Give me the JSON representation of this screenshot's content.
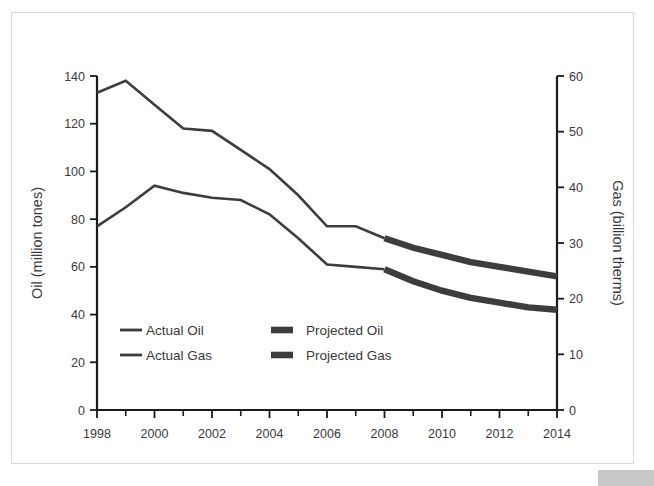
{
  "figure": {
    "background_color": "#ffffff",
    "frame_color": "#d9d9d9",
    "line_color": "#3d3d3d",
    "corner_block_color": "#c9c9c9"
  },
  "chart_data": {
    "type": "line",
    "title": "",
    "xlabel": "",
    "ylabel": "Oil (million tones)",
    "y2label": "Gas (billion therms)",
    "x": [
      1998,
      1999,
      2000,
      2001,
      2002,
      2003,
      2004,
      2005,
      2006,
      2007,
      2008,
      2009,
      2010,
      2011,
      2012,
      2013,
      2014
    ],
    "xtick_labels": [
      "1998",
      "2000",
      "2002",
      "2004",
      "2006",
      "2008",
      "2010",
      "2012",
      "2014"
    ],
    "xtick_values": [
      1998,
      2000,
      2002,
      2004,
      2006,
      2008,
      2010,
      2012,
      2014
    ],
    "xlim": [
      1998,
      2014
    ],
    "ylim": [
      0,
      140
    ],
    "ytick_labels": [
      "0",
      "20",
      "40",
      "60",
      "80",
      "100",
      "120",
      "140"
    ],
    "ytick_values": [
      0,
      20,
      40,
      60,
      80,
      100,
      120,
      140
    ],
    "y2lim": [
      0,
      60
    ],
    "y2tick_labels": [
      "0",
      "10",
      "20",
      "30",
      "40",
      "50",
      "60"
    ],
    "y2tick_values": [
      0,
      10,
      20,
      30,
      40,
      50,
      60
    ],
    "grid": false,
    "legend_position": "inside-lower-left",
    "series": [
      {
        "name": "Actual Oil",
        "style": "thin",
        "axis": "left",
        "units": "million tones",
        "x": [
          1998,
          1999,
          2000,
          2001,
          2002,
          2003,
          2004,
          2005,
          2006,
          2007,
          2008
        ],
        "values": [
          133,
          138,
          128,
          118,
          117,
          109,
          101,
          90,
          77,
          77,
          72
        ]
      },
      {
        "name": "Projected Oil",
        "style": "thick",
        "axis": "left",
        "units": "million tones",
        "x": [
          2008,
          2009,
          2010,
          2011,
          2012,
          2013,
          2014
        ],
        "values": [
          72,
          68,
          65,
          62,
          60,
          58,
          56
        ]
      },
      {
        "name": "Actual Gas",
        "style": "thin",
        "axis": "left",
        "units": "million tones equivalent",
        "x": [
          1998,
          1999,
          2000,
          2001,
          2002,
          2003,
          2004,
          2005,
          2006,
          2007,
          2008
        ],
        "values": [
          77,
          85,
          94,
          91,
          89,
          88,
          82,
          72,
          61,
          60,
          59
        ]
      },
      {
        "name": "Projected Gas",
        "style": "thick",
        "axis": "left",
        "units": "million tones equivalent",
        "x": [
          2008,
          2009,
          2010,
          2011,
          2012,
          2013,
          2014
        ],
        "values": [
          59,
          54,
          50,
          47,
          45,
          43,
          42
        ]
      }
    ]
  },
  "axes": {
    "left_title": "Oil (million tones)",
    "right_title": "Gas (billion therms)"
  },
  "legend": {
    "entries": [
      {
        "label": "Actual Oil",
        "style": "thin"
      },
      {
        "label": "Projected Oil",
        "style": "thick"
      },
      {
        "label": "Actual Gas",
        "style": "thin"
      },
      {
        "label": "Projected Gas",
        "style": "thick"
      }
    ]
  }
}
